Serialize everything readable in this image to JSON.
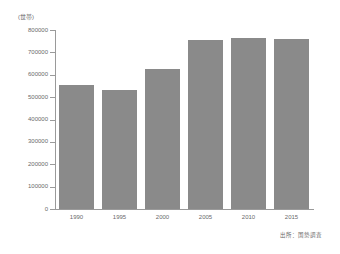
{
  "chart_data": {
    "type": "bar",
    "title": "",
    "subtitle": "",
    "xlabel": "",
    "ylabel": "(世帯)",
    "unit_label": "(世帯)",
    "categories": [
      "1990",
      "1995",
      "2000",
      "2005",
      "2010",
      "2015"
    ],
    "values": [
      555000,
      532000,
      628000,
      757000,
      763000,
      760000
    ],
    "series": [
      {
        "name": "世帯数",
        "values": [
          555000,
          532000,
          628000,
          757000,
          763000,
          760000
        ]
      }
    ],
    "ylim": [
      0,
      800000
    ],
    "ytick_values": [
      0,
      100000,
      200000,
      300000,
      400000,
      500000,
      600000,
      700000,
      800000
    ],
    "ytick_labels": [
      "0",
      "100000",
      "200000",
      "300000",
      "400000",
      "500000",
      "600000",
      "700000",
      "800000"
    ],
    "grid": false,
    "legend": false,
    "legend_position": "none",
    "bar_color": "#8a8a8a",
    "axis_color": "#9a9a9a",
    "text_color": "#6a6a6a",
    "background_color": "#ffffff",
    "source_note": "出所：国勢調査",
    "annotations": []
  }
}
